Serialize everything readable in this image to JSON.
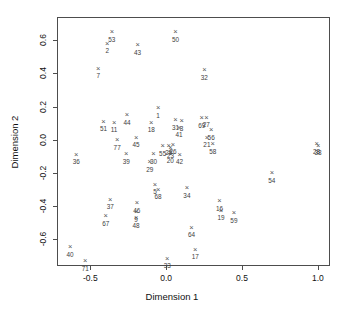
{
  "chart_data": {
    "type": "scatter",
    "title": "",
    "xlabel": "Dimension 1",
    "ylabel": "Dimension 2",
    "xlim": [
      -0.72,
      1.08
    ],
    "ylim": [
      -0.76,
      0.74
    ],
    "xticks": [
      -0.5,
      0.0,
      0.5,
      1.0
    ],
    "xticklabels": [
      "-0.5",
      "0.0",
      "0.5",
      "1.0"
    ],
    "yticks": [
      -0.6,
      -0.4,
      -0.2,
      0.0,
      0.2,
      0.4,
      0.6
    ],
    "yticklabels": [
      "-0.6",
      "-0.4",
      "-0.2",
      "0.0",
      "0.2",
      "0.4",
      "0.6"
    ],
    "grid": false,
    "legend": false,
    "marker": "x",
    "marker_color": "#555555",
    "label_color": "#3d3d3d",
    "frame_color": "#4d4d4d",
    "points": [
      {
        "label": "53",
        "x": -0.365,
        "y": 0.655
      },
      {
        "label": "50",
        "x": 0.055,
        "y": 0.655
      },
      {
        "label": "2",
        "x": -0.395,
        "y": 0.585
      },
      {
        "label": "43",
        "x": -0.195,
        "y": 0.575
      },
      {
        "label": "7",
        "x": -0.455,
        "y": 0.435
      },
      {
        "label": "32",
        "x": 0.245,
        "y": 0.425
      },
      {
        "label": "1",
        "x": -0.06,
        "y": 0.195
      },
      {
        "label": "44",
        "x": -0.265,
        "y": 0.155
      },
      {
        "label": "51",
        "x": -0.42,
        "y": 0.115
      },
      {
        "label": "11",
        "x": -0.35,
        "y": 0.11
      },
      {
        "label": "18",
        "x": -0.105,
        "y": 0.11
      },
      {
        "label": "31",
        "x": 0.055,
        "y": 0.125
      },
      {
        "label": "8",
        "x": 0.095,
        "y": 0.118
      },
      {
        "label": "69",
        "x": 0.228,
        "y": 0.135
      },
      {
        "label": "27",
        "x": 0.258,
        "y": 0.14
      },
      {
        "label": "41",
        "x": 0.078,
        "y": 0.08
      },
      {
        "label": "56",
        "x": 0.29,
        "y": 0.065
      },
      {
        "label": "45",
        "x": -0.205,
        "y": 0.018
      },
      {
        "label": "77",
        "x": -0.33,
        "y": 0.005
      },
      {
        "label": "21",
        "x": 0.262,
        "y": 0.02
      },
      {
        "label": "58",
        "x": 0.3,
        "y": -0.02
      },
      {
        "label": "28",
        "x": 0.985,
        "y": -0.022
      },
      {
        "label": "38",
        "x": 0.995,
        "y": -0.03
      },
      {
        "label": "36",
        "x": -0.6,
        "y": -0.085
      },
      {
        "label": "39",
        "x": -0.27,
        "y": -0.08
      },
      {
        "label": "55",
        "x": -0.03,
        "y": -0.032
      },
      {
        "label": "25",
        "x": 0.01,
        "y": -0.03
      },
      {
        "label": "26",
        "x": 0.038,
        "y": -0.025
      },
      {
        "label": "23",
        "x": 0.022,
        "y": -0.045
      },
      {
        "label": "20",
        "x": 0.02,
        "y": -0.075
      },
      {
        "label": "42",
        "x": 0.082,
        "y": -0.085
      },
      {
        "label": "30",
        "x": -0.09,
        "y": -0.08
      },
      {
        "label": "29",
        "x": -0.115,
        "y": -0.13
      },
      {
        "label": "54",
        "x": 0.69,
        "y": -0.195
      },
      {
        "label": "5",
        "x": -0.08,
        "y": -0.265
      },
      {
        "label": "68",
        "x": -0.06,
        "y": -0.295
      },
      {
        "label": "34",
        "x": 0.13,
        "y": -0.285
      },
      {
        "label": "37",
        "x": -0.375,
        "y": -0.355
      },
      {
        "label": "46",
        "x": -0.2,
        "y": -0.375
      },
      {
        "label": "16",
        "x": 0.345,
        "y": -0.365
      },
      {
        "label": "19",
        "x": 0.355,
        "y": -0.42
      },
      {
        "label": "59",
        "x": 0.44,
        "y": -0.435
      },
      {
        "label": "67",
        "x": -0.405,
        "y": -0.455
      },
      {
        "label": "9",
        "x": -0.205,
        "y": -0.43
      },
      {
        "label": "48",
        "x": -0.205,
        "y": -0.465
      },
      {
        "label": "64",
        "x": 0.16,
        "y": -0.525
      },
      {
        "label": "40",
        "x": -0.64,
        "y": -0.64
      },
      {
        "label": "17",
        "x": 0.185,
        "y": -0.655
      },
      {
        "label": "33",
        "x": 0.0,
        "y": -0.71
      },
      {
        "label": "71",
        "x": -0.54,
        "y": -0.725
      }
    ]
  },
  "axes": {
    "xlabel": "Dimension 1",
    "ylabel": "Dimension 2"
  }
}
